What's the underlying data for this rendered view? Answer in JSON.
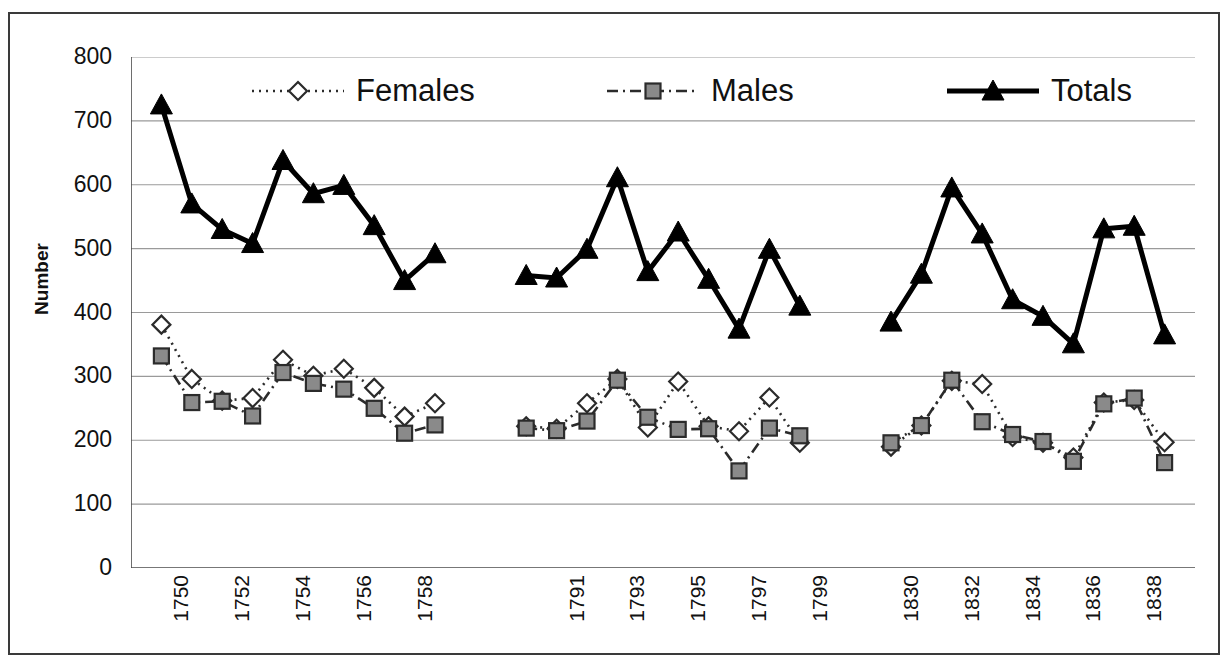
{
  "chart_data": {
    "type": "line",
    "title": "",
    "xlabel": "",
    "ylabel": "Number",
    "ylim": [
      0,
      800
    ],
    "ytick_values": [
      0,
      100,
      200,
      300,
      400,
      500,
      600,
      700,
      800
    ],
    "ytick_labels": [
      "0",
      "100",
      "200",
      "300",
      "400",
      "500",
      "600",
      "700",
      "800"
    ],
    "grid": true,
    "legend_position": "top-inside",
    "x_axis_note": "Three discontinuous year blocks separated by gaps; every other year labelled",
    "x_groups": [
      {
        "x": [
          1750,
          1751,
          1752,
          1753,
          1754,
          1755,
          1756,
          1757,
          1758,
          1759
        ],
        "tick_labels": [
          "1750",
          "",
          "1752",
          "",
          "1754",
          "",
          "1756",
          "",
          "1758",
          ""
        ]
      },
      {
        "x": [
          1790,
          1791,
          1792,
          1793,
          1794,
          1795,
          1796,
          1797,
          1798,
          1799
        ],
        "tick_labels": [
          "",
          "1791",
          "",
          "1793",
          "",
          "1795",
          "",
          "1797",
          "",
          "1799"
        ]
      },
      {
        "x": [
          1830,
          1831,
          1832,
          1833,
          1834,
          1835,
          1836,
          1837,
          1838,
          1839
        ],
        "tick_labels": [
          "1830",
          "",
          "1832",
          "",
          "1834",
          "",
          "1836",
          "",
          "1838",
          ""
        ]
      }
    ],
    "series": [
      {
        "name": "Females",
        "marker": "open-diamond",
        "line_style": "dotted",
        "color": "#3a3a3a",
        "groups": [
          [
            381,
            296,
            262,
            266,
            326,
            301,
            312,
            282,
            237,
            258
          ],
          [
            222,
            218,
            258,
            296,
            220,
            292,
            222,
            214,
            267,
            196
          ],
          [
            190,
            223,
            293,
            288,
            205,
            196,
            173,
            259,
            263,
            197
          ]
        ]
      },
      {
        "name": "Males",
        "marker": "filled-square",
        "line_style": "dash-dot",
        "color": "#6e6e6e",
        "groups": [
          [
            332,
            259,
            261,
            238,
            306,
            289,
            280,
            250,
            211,
            224
          ],
          [
            219,
            215,
            230,
            294,
            236,
            217,
            218,
            152,
            219,
            207
          ],
          [
            196,
            223,
            294,
            229,
            209,
            198,
            167,
            257,
            266,
            165
          ]
        ]
      },
      {
        "name": "Totals",
        "marker": "filled-triangle",
        "line_style": "solid",
        "color": "#000000",
        "groups": [
          [
            725,
            570,
            530,
            508,
            638,
            586,
            599,
            536,
            450,
            492
          ],
          [
            458,
            454,
            499,
            611,
            464,
            526,
            452,
            374,
            499,
            410
          ],
          [
            385,
            460,
            595,
            523,
            420,
            394,
            351,
            531,
            535,
            365
          ]
        ]
      }
    ]
  },
  "legend": {
    "entries": [
      {
        "label": "Females",
        "icon": "open-diamond-marker-icon"
      },
      {
        "label": "Males",
        "icon": "filled-square-marker-icon"
      },
      {
        "label": "Totals",
        "icon": "filled-triangle-marker-icon"
      }
    ]
  },
  "axes": {
    "y_title": "Number"
  }
}
